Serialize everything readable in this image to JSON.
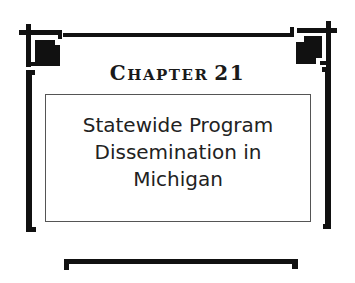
{
  "chapter": {
    "label_first": "C",
    "label_rest": "HAPTER",
    "number": "21"
  },
  "title": {
    "lines": [
      "Statewide Program",
      "Dissemination in",
      "Michigan"
    ]
  },
  "colors": {
    "ink": "#111111",
    "box_border": "#555555",
    "background": "#ffffff"
  }
}
